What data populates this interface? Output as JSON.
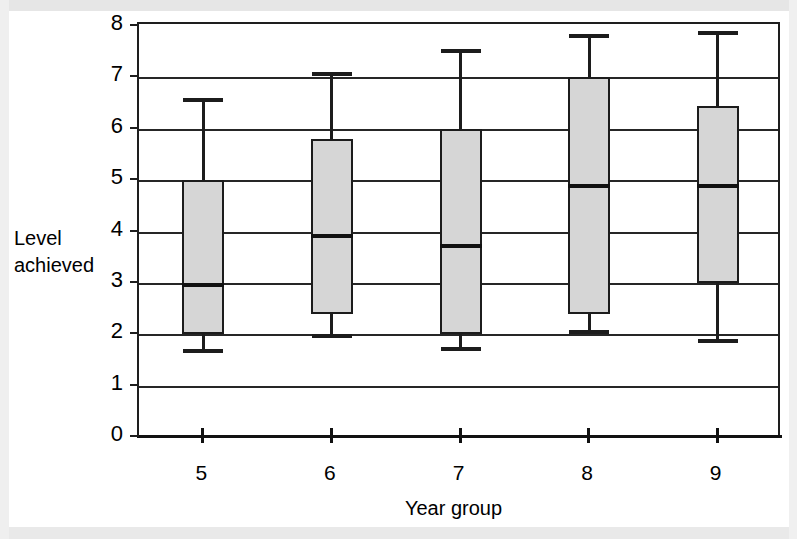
{
  "chart_data": {
    "type": "box",
    "title": "",
    "xlabel": "Year group",
    "ylabel": "Level\nachieved",
    "ylabel_lines": [
      "Level",
      "achieved"
    ],
    "categories": [
      "5",
      "6",
      "7",
      "8",
      "9"
    ],
    "x_tick_labels": [
      "5",
      "6",
      "7",
      "8",
      "9"
    ],
    "y_tick_labels": [
      "0",
      "1",
      "2",
      "3",
      "4",
      "5",
      "6",
      "7",
      "8"
    ],
    "ylim": [
      0,
      8
    ],
    "y_gridlines": [
      1,
      2,
      3,
      4,
      5,
      6,
      7,
      8
    ],
    "grid": true,
    "legend": "none",
    "boxes": [
      {
        "category": "5",
        "whisker_low": 1.72,
        "q1": 2.0,
        "median": 3.0,
        "q3": 5.0,
        "whisker_high": 6.6
      },
      {
        "category": "6",
        "whisker_low": 2.0,
        "q1": 2.4,
        "median": 3.95,
        "q3": 5.8,
        "whisker_high": 7.1
      },
      {
        "category": "7",
        "whisker_low": 1.75,
        "q1": 2.0,
        "median": 3.75,
        "q3": 6.0,
        "whisker_high": 7.55
      },
      {
        "category": "8",
        "whisker_low": 2.08,
        "q1": 2.4,
        "median": 4.93,
        "q3": 7.0,
        "whisker_high": 7.85
      },
      {
        "category": "9",
        "whisker_low": 1.9,
        "q1": 3.0,
        "median": 4.93,
        "q3": 6.45,
        "whisker_high": 7.9
      }
    ],
    "colors": {
      "box_fill": "#d6d6d6",
      "line": "#1c1c1c",
      "background": "#ffffff"
    }
  }
}
